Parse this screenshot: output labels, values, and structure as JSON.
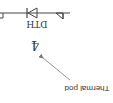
{
  "orientation": "rotated-180",
  "colors": {
    "wire": "#444444",
    "text": "#333333",
    "arrow": "#777777",
    "background": "#ffffff"
  },
  "diagram": {
    "component": {
      "type": "diode",
      "label": "DTH",
      "pin_number": "4"
    },
    "annotation": {
      "text": "Thermal pod",
      "icon": "arrow-icon"
    },
    "markers": [
      "ground-triangle-icon",
      "ground-triangle-icon"
    ]
  }
}
